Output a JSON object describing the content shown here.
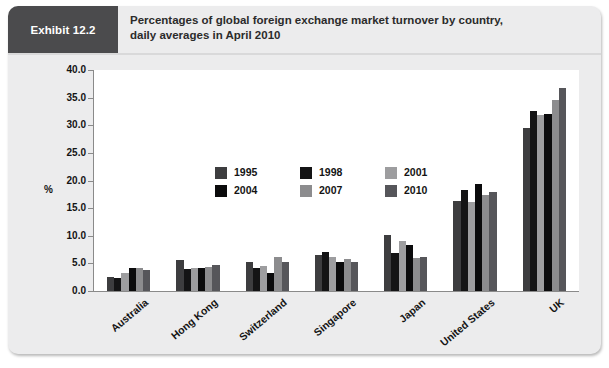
{
  "exhibit": {
    "tab_label": "Exhibit 12.2",
    "title_line1": "Percentages of global foreign exchange market turnover by country,",
    "title_line2": "daily averages in April 2010"
  },
  "legend": {
    "items": [
      {
        "label": "1995",
        "color": "#3d3d3f"
      },
      {
        "label": "1998",
        "color": "#141415"
      },
      {
        "label": "2001",
        "color": "#9d9d9f"
      },
      {
        "label": "2004",
        "color": "#0b0b0c"
      },
      {
        "label": "2007",
        "color": "#8c8c8e"
      },
      {
        "label": "2010",
        "color": "#56565a"
      }
    ]
  },
  "chart_data": {
    "type": "bar",
    "title": "Percentages of global foreign exchange market turnover by country, daily averages in April 2010",
    "xlabel": "",
    "ylabel": "%",
    "ylim": [
      0,
      40
    ],
    "yticks": [
      "0.0",
      "5.0",
      "10.0",
      "15.0",
      "20.0",
      "25.0",
      "30.0",
      "35.0",
      "40.0"
    ],
    "ytick_values": [
      0,
      5,
      10,
      15,
      20,
      25,
      30,
      35,
      40
    ],
    "grid": false,
    "legend_position": "upper-left-inside",
    "categories": [
      "Australia",
      "Hong Kong",
      "Switzerland",
      "Singapore",
      "Japan",
      "United States",
      "UK"
    ],
    "series": [
      {
        "name": "1995",
        "color": "#3d3d3f",
        "values": [
          2.5,
          5.6,
          5.2,
          6.6,
          10.2,
          16.3,
          29.5
        ]
      },
      {
        "name": "1998",
        "color": "#141415",
        "values": [
          2.4,
          4.0,
          4.2,
          7.1,
          6.9,
          18.3,
          32.5
        ]
      },
      {
        "name": "2001",
        "color": "#9d9d9f",
        "values": [
          3.2,
          4.1,
          4.5,
          6.2,
          9.1,
          16.1,
          31.8
        ]
      },
      {
        "name": "2004",
        "color": "#0b0b0c",
        "values": [
          4.2,
          4.2,
          3.3,
          5.2,
          8.3,
          19.4,
          32.0
        ]
      },
      {
        "name": "2007",
        "color": "#8c8c8e",
        "values": [
          4.2,
          4.4,
          6.1,
          5.8,
          6.0,
          17.4,
          34.6
        ]
      },
      {
        "name": "2010",
        "color": "#56565a",
        "values": [
          3.8,
          4.7,
          5.2,
          5.3,
          6.2,
          17.9,
          36.7
        ]
      }
    ]
  }
}
